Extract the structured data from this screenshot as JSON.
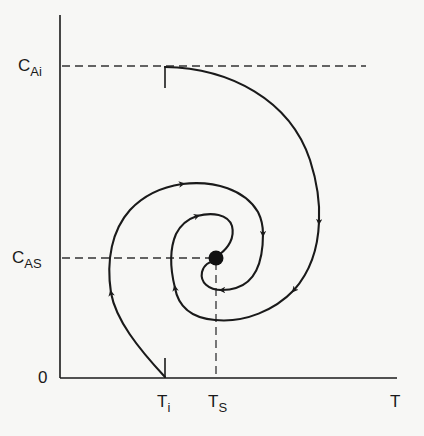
{
  "diagram": {
    "type": "phase-plane",
    "axes": {
      "x": {
        "label": "T",
        "origin_label": "0"
      },
      "y": {
        "label_main": "C",
        "label_sub_top": "Ai",
        "label_sub_mid": "AS"
      }
    },
    "labels": {
      "y_top": {
        "main": "C",
        "sub": "Ai"
      },
      "y_mid": {
        "main": "C",
        "sub": "AS"
      },
      "origin": "0",
      "x_left": {
        "main": "T",
        "sub": "i"
      },
      "x_mid": {
        "main": "T",
        "sub": "S"
      },
      "x_axis": "T"
    },
    "points": {
      "initial_top": {
        "name": "(T_i, C_Ai)",
        "description": "start of trajectory 1"
      },
      "initial_bottom": {
        "name": "(T_i, 0)",
        "description": "start of trajectory 2"
      },
      "steady_state": {
        "name": "(T_S, C_AS)",
        "description": "stable focus, filled dot"
      }
    },
    "trajectories": [
      {
        "id": "trajectory-1",
        "start": "(T_i, C_Ai)",
        "end": "(T_S, C_AS)",
        "direction": "clockwise spiral inward",
        "arrows": 5
      },
      {
        "id": "trajectory-2",
        "start": "(T_i, 0)",
        "end": "(T_S, C_AS)",
        "direction": "clockwise spiral inward",
        "arrows": 4
      }
    ],
    "colors": {
      "stroke": "#1a1a1a",
      "background": "#f7f7f5"
    }
  }
}
